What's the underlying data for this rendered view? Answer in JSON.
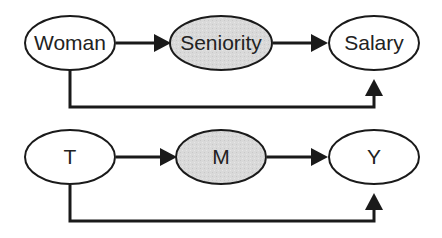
{
  "colors": {
    "stroke": "#1a1a1a",
    "node_fill": "#ffffff",
    "mediator_fill": "#d9d9d9",
    "background": "#ffffff"
  },
  "diagrams": [
    {
      "nodes": [
        {
          "id": "treatment",
          "label": "Woman",
          "shaded": false
        },
        {
          "id": "mediator",
          "label": "Seniority",
          "shaded": true
        },
        {
          "id": "outcome",
          "label": "Salary",
          "shaded": false
        }
      ],
      "edges": [
        {
          "from": "Woman",
          "to": "Seniority"
        },
        {
          "from": "Seniority",
          "to": "Salary"
        },
        {
          "from": "Woman",
          "to": "Salary",
          "routing": "below"
        }
      ]
    },
    {
      "nodes": [
        {
          "id": "treatment",
          "label": "T",
          "shaded": false
        },
        {
          "id": "mediator",
          "label": "M",
          "shaded": true
        },
        {
          "id": "outcome",
          "label": "Y",
          "shaded": false
        }
      ],
      "edges": [
        {
          "from": "T",
          "to": "M"
        },
        {
          "from": "M",
          "to": "Y"
        },
        {
          "from": "T",
          "to": "Y",
          "routing": "below"
        }
      ]
    }
  ]
}
